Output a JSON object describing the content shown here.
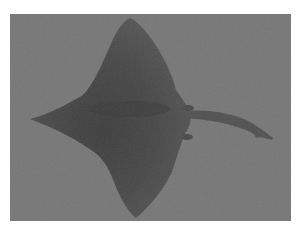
{
  "image": {
    "subject": "eagle ray",
    "alt": "Grayscale photograph of a ray (top view) with wide pointed pectoral fins and a long thin tail, on a plain gray background",
    "colors": {
      "border": "#ffffff",
      "background": "#767676",
      "body": "#4a4a4a",
      "body_dark": "#3c3c3c",
      "fin_light": "#6e6e6e"
    }
  }
}
